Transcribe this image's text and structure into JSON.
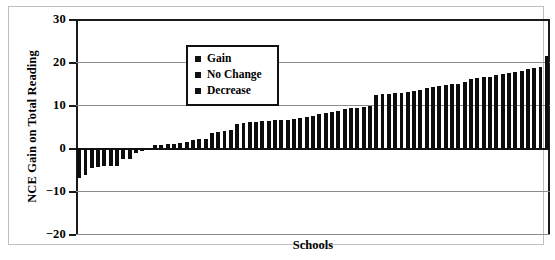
{
  "chart_data": {
    "type": "bar",
    "title": "",
    "xlabel": "Schools",
    "ylabel": "NCE Gain on Total Reading",
    "ylim": [
      -20,
      30
    ],
    "yticks": [
      30,
      20,
      10,
      0,
      -10,
      -20
    ],
    "ytick_labels": [
      "30",
      "20",
      "10",
      "0",
      "−10",
      "−20"
    ],
    "grid": true,
    "grid_axis": "y",
    "legend_position": "upper-left-inside",
    "legend": [
      {
        "label": "Gain",
        "marker": "square",
        "color": "#111111"
      },
      {
        "label": "No Change",
        "marker": "square",
        "color": "#111111"
      },
      {
        "label": "Decrease",
        "marker": "square",
        "color": "#111111"
      }
    ],
    "categories": [
      "1",
      "2",
      "3",
      "4",
      "5",
      "6",
      "7",
      "8",
      "9",
      "10",
      "11",
      "12",
      "13",
      "14",
      "15",
      "16",
      "17",
      "18",
      "19",
      "20",
      "21",
      "22",
      "23",
      "24",
      "25",
      "26",
      "27",
      "28",
      "29",
      "30",
      "31",
      "32",
      "33",
      "34",
      "35",
      "36",
      "37",
      "38",
      "39",
      "40",
      "41",
      "42",
      "43",
      "44",
      "45",
      "46",
      "47",
      "48",
      "49",
      "50",
      "51",
      "52",
      "53",
      "54",
      "55",
      "56",
      "57",
      "58",
      "59",
      "60",
      "61",
      "62",
      "63",
      "64",
      "65",
      "66",
      "67",
      "68",
      "69",
      "70",
      "71",
      "72",
      "73",
      "74",
      "75"
    ],
    "values": [
      -7.0,
      -6.2,
      -4.6,
      -4.4,
      -4.3,
      -4.2,
      -4.1,
      -2.6,
      -2.5,
      -1.2,
      -0.6,
      -0.4,
      0.6,
      0.8,
      0.9,
      1.0,
      1.2,
      1.5,
      1.8,
      2.0,
      2.2,
      3.6,
      3.8,
      4.0,
      4.2,
      5.6,
      5.8,
      6.0,
      6.1,
      6.2,
      6.3,
      6.4,
      6.5,
      6.6,
      6.8,
      7.0,
      7.2,
      7.4,
      8.0,
      8.2,
      8.4,
      8.6,
      9.0,
      9.2,
      9.4,
      9.6,
      9.8,
      12.4,
      12.5,
      12.6,
      12.7,
      12.8,
      13.0,
      13.2,
      13.4,
      14.0,
      14.2,
      14.4,
      14.6,
      14.8,
      15.0,
      15.4,
      16.0,
      16.2,
      16.4,
      16.6,
      17.0,
      17.2,
      17.4,
      17.6,
      18.0,
      18.4,
      18.6,
      18.8,
      21.5
    ],
    "bar_color": "#0d0d0d",
    "series_name": "NCE Gain on Total Reading"
  },
  "axes": {
    "x_title": "Schools",
    "y_title": "NCE Gain on Total Reading"
  },
  "legend": {
    "items": [
      {
        "label": "Gain"
      },
      {
        "label": "No Change"
      },
      {
        "label": "Decrease"
      }
    ]
  }
}
